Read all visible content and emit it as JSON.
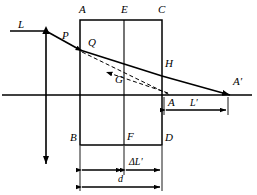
{
  "figure": {
    "type": "optical-ray-diagram",
    "title": "",
    "background_color": "#ffffff",
    "stroke_color": "#000000"
  },
  "labels": {
    "incident_ray": "L",
    "point_p": "P",
    "point_q": "Q",
    "corner_a_top": "A",
    "point_e": "E",
    "corner_c": "C",
    "point_h": "H",
    "point_g": "G",
    "image_point": "A′",
    "axis_point_a": "A",
    "corner_b": "B",
    "point_f": "F",
    "corner_d": "D"
  },
  "dimensions": {
    "l_prime": "L′",
    "d_bar": "d",
    "d_bar_has_overbar": true,
    "delta_l_prime": "ΔL′",
    "d_total": "d"
  },
  "geometry": {
    "optical_axis_y": 95,
    "block": {
      "left": 80,
      "right": 162,
      "top": 20,
      "bottom": 145
    },
    "divider_x": 124,
    "object_line_x": 46,
    "object_arrow_top_y": 28,
    "object_arrow_bottom_y": 166,
    "ray_entry": {
      "x": 80,
      "y": 50
    },
    "ray_exit": {
      "x": 162,
      "y": 76
    },
    "image_x": 228
  },
  "elements": {
    "solid_lines": "incident ray, refracted ray, emergent ray, block outline, optical axis, object arrow",
    "dashed_lines": "virtual ray extensions through G",
    "arrowheads": "incident ray, emergent ray to A-prime, object arrow both ends, dimension arrows"
  }
}
